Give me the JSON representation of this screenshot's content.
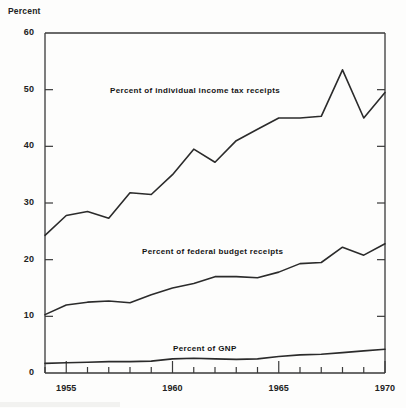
{
  "figure": {
    "axis_title": "Percent",
    "background_color": "#fdfdfc",
    "line_color": "#2b2b2b",
    "axis_color": "#3a3a3a"
  },
  "axes": {
    "y_ticks": [
      "0",
      "10",
      "20",
      "30",
      "40",
      "50",
      "60"
    ],
    "x_ticks": [
      "1955",
      "1960",
      "1965",
      "1970"
    ]
  },
  "series_labels": {
    "income_tax": "Percent of individual income tax receipts",
    "federal_budget": "Percent of federal budget receipts",
    "gnp": "Percent of GNP"
  },
  "chart_data": {
    "type": "line",
    "title": "",
    "subtitle": "",
    "xlabel": "",
    "ylabel": "Percent",
    "xlim": [
      1954,
      1970
    ],
    "ylim": [
      0,
      60
    ],
    "grid": false,
    "legend_position": "inline-annotations",
    "y_tick_values": [
      0,
      10,
      20,
      30,
      40,
      50,
      60
    ],
    "x_tick_values": [
      1955,
      1960,
      1965,
      1970
    ],
    "x_minor_tick_interval": 1,
    "x": [
      1954,
      1955,
      1956,
      1957,
      1958,
      1959,
      1960,
      1961,
      1962,
      1963,
      1964,
      1965,
      1966,
      1967,
      1968,
      1969,
      1970
    ],
    "series": [
      {
        "name": "Percent of individual income tax receipts",
        "values": [
          24.3,
          27.8,
          28.5,
          27.3,
          31.8,
          31.5,
          35.0,
          39.5,
          37.2,
          41.0,
          43.0,
          45.0,
          45.0,
          45.3,
          53.5,
          45.0,
          49.5
        ],
        "annotation": "Percent of individual income tax receipts"
      },
      {
        "name": "Percent of federal budget receipts",
        "values": [
          10.3,
          12.0,
          12.5,
          12.7,
          12.4,
          13.8,
          15.0,
          15.8,
          17.0,
          17.0,
          16.8,
          17.8,
          19.3,
          19.5,
          22.2,
          20.8,
          22.8
        ],
        "annotation": "Percent of federal budget receipts"
      },
      {
        "name": "Percent of GNP",
        "values": [
          1.7,
          1.8,
          1.9,
          2.0,
          2.0,
          2.1,
          2.5,
          2.6,
          2.5,
          2.4,
          2.5,
          2.9,
          3.2,
          3.3,
          3.6,
          3.9,
          4.2
        ],
        "annotation": "Percent of GNP"
      }
    ]
  }
}
